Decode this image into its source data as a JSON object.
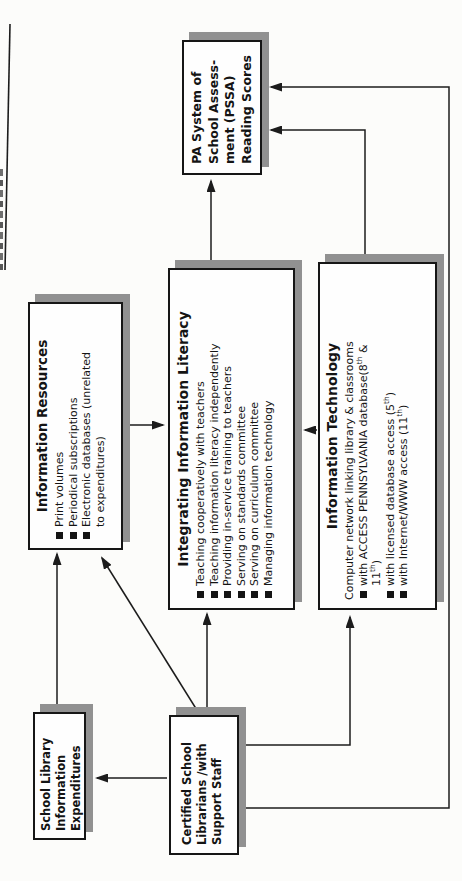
{
  "theme": {
    "line_color": "#1c1c1c",
    "border_color": "#161616",
    "shadow_color": "#919191",
    "box_bg": "#fefefe",
    "text_color": "#141414",
    "page_bg": "#fbfbf9"
  },
  "boxes": {
    "expenditures": {
      "lines": [
        "School Library",
        "Information",
        "Expenditures"
      ]
    },
    "certified": {
      "lines": [
        "Certified School",
        "Librarians /with",
        "Support Staff"
      ]
    },
    "resources": {
      "title": "Information Resources",
      "bullets": [
        "Print volumes",
        "Periodical subscriptions",
        "Electronic databases (unrelated"
      ],
      "bullet3_cont": "to expenditures)"
    },
    "integrating": {
      "title": "Integrating Information Literacy",
      "bullets": [
        "Teaching cooperatively with teachers",
        "Teaching information literacy independently",
        "Providing in-service training to teachers",
        "Serving on standards committee",
        "Serving on curriculum committee",
        "Managing information technology"
      ]
    },
    "it": {
      "title": "Information Technology",
      "intro": "Computer network linking library & classrooms",
      "b1_pre": "with ACCESS PENNSYLVANIA database(8",
      "b1_sup1": "th",
      "b1_mid": " &",
      "b1_cont": "11",
      "b1_sup2": "th",
      "b1_post": ")",
      "b2_pre": "with licensed database access (5",
      "b2_sup": "th",
      "b2_post": ")",
      "b3_pre": "with Internet/WWW access (11",
      "b3_sup": "th",
      "b3_post": ")"
    },
    "pssa": {
      "lines": [
        "PA System of",
        "School Assess-",
        "ment (PSSA)",
        "Reading Scores"
      ]
    }
  },
  "edges": [
    {
      "from": "school-library-expenditures",
      "to": "information-resources"
    },
    {
      "from": "certified-school-librarians",
      "to": "school-library-expenditures"
    },
    {
      "from": "certified-school-librarians",
      "to": "information-resources"
    },
    {
      "from": "certified-school-librarians",
      "to": "integrating-information-literacy"
    },
    {
      "from": "certified-school-librarians",
      "to": "information-technology"
    },
    {
      "from": "certified-school-librarians",
      "to": "pssa-reading-scores"
    },
    {
      "from": "information-resources",
      "to": "integrating-information-literacy"
    },
    {
      "from": "information-technology",
      "to": "integrating-information-literacy"
    },
    {
      "from": "integrating-information-literacy",
      "to": "pssa-reading-scores"
    },
    {
      "from": "information-technology",
      "to": "pssa-reading-scores"
    }
  ]
}
